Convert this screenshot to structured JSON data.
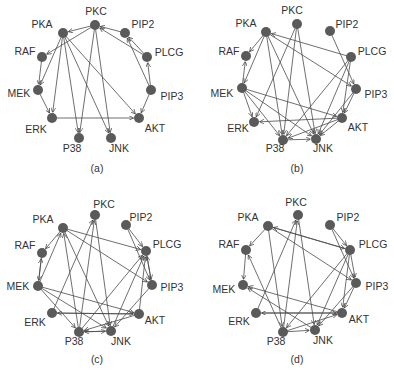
{
  "figure": {
    "panels": [
      {
        "caption": "(a)",
        "caption_pos": [
          97,
          172
        ],
        "nodes": {
          "PKC": {
            "x": 95,
            "y": 25,
            "lx": 96,
            "ly": 15,
            "anchor": "middle"
          },
          "PKA": {
            "x": 63,
            "y": 33,
            "lx": 42,
            "ly": 28,
            "anchor": "middle"
          },
          "PIP2": {
            "x": 125,
            "y": 33,
            "lx": 143,
            "ly": 28,
            "anchor": "middle"
          },
          "RAF": {
            "x": 42,
            "y": 57,
            "lx": 25,
            "ly": 55,
            "anchor": "middle"
          },
          "PLCG": {
            "x": 147,
            "y": 57,
            "lx": 169,
            "ly": 56,
            "anchor": "middle"
          },
          "MEK": {
            "x": 38,
            "y": 90,
            "lx": 19,
            "ly": 97,
            "anchor": "middle"
          },
          "PIP3": {
            "x": 151,
            "y": 90,
            "lx": 172,
            "ly": 100,
            "anchor": "middle"
          },
          "ERK": {
            "x": 52,
            "y": 118,
            "lx": 36,
            "ly": 133,
            "anchor": "middle"
          },
          "AKT": {
            "x": 139,
            "y": 118,
            "lx": 155,
            "ly": 132,
            "anchor": "middle"
          },
          "P38": {
            "x": 79,
            "y": 138,
            "lx": 72,
            "ly": 152,
            "anchor": "middle"
          },
          "JNK": {
            "x": 111,
            "y": 138,
            "lx": 119,
            "ly": 152,
            "anchor": "middle"
          }
        },
        "edges": [
          [
            "PKC",
            "PKA"
          ],
          [
            "PKC",
            "RAF"
          ],
          [
            "PKC",
            "P38"
          ],
          [
            "PKC",
            "JNK"
          ],
          [
            "PIP2",
            "PKC"
          ],
          [
            "PLCG",
            "PKC"
          ],
          [
            "PLCG",
            "PIP2"
          ],
          [
            "PIP3",
            "PLCG"
          ],
          [
            "PIP3",
            "PIP2"
          ],
          [
            "PIP3",
            "AKT"
          ],
          [
            "PKA",
            "MEK"
          ],
          [
            "PKA",
            "ERK"
          ],
          [
            "PKA",
            "P38"
          ],
          [
            "PKA",
            "JNK"
          ],
          [
            "PKA",
            "AKT"
          ],
          [
            "RAF",
            "MEK"
          ],
          [
            "MEK",
            "ERK"
          ],
          [
            "ERK",
            "AKT"
          ]
        ]
      },
      {
        "caption": "(b)",
        "caption_pos": [
          297,
          172
        ],
        "nodes": {
          "PKC": {
            "x": 297,
            "y": 24,
            "lx": 292,
            "ly": 14,
            "anchor": "middle"
          },
          "PKA": {
            "x": 266,
            "y": 32,
            "lx": 246,
            "ly": 27,
            "anchor": "middle"
          },
          "PIP2": {
            "x": 330,
            "y": 31,
            "lx": 347,
            "ly": 28,
            "anchor": "middle"
          },
          "RAF": {
            "x": 246,
            "y": 56,
            "lx": 229,
            "ly": 55,
            "anchor": "middle"
          },
          "PLCG": {
            "x": 351,
            "y": 57,
            "lx": 372,
            "ly": 55,
            "anchor": "middle"
          },
          "MEK": {
            "x": 242,
            "y": 88,
            "lx": 222,
            "ly": 97,
            "anchor": "middle"
          },
          "PIP3": {
            "x": 356,
            "y": 89,
            "lx": 376,
            "ly": 98,
            "anchor": "middle"
          },
          "ERK": {
            "x": 254,
            "y": 122,
            "lx": 238,
            "ly": 132,
            "anchor": "middle"
          },
          "AKT": {
            "x": 342,
            "y": 118,
            "lx": 358,
            "ly": 131,
            "anchor": "middle"
          },
          "P38": {
            "x": 283,
            "y": 140,
            "lx": 275,
            "ly": 152,
            "anchor": "middle"
          },
          "JNK": {
            "x": 316,
            "y": 139,
            "lx": 323,
            "ly": 152,
            "anchor": "middle"
          }
        },
        "edges": [
          [
            "PKA",
            "RAF"
          ],
          [
            "PKA",
            "MEK"
          ],
          [
            "PKA",
            "P38"
          ],
          [
            "PKA",
            "JNK"
          ],
          [
            "PKA",
            "PIP3"
          ],
          [
            "PLCG",
            "PKA"
          ],
          [
            "PKC",
            "ERK"
          ],
          [
            "PKC",
            "P38"
          ],
          [
            "PKC",
            "JNK"
          ],
          [
            "PIP2",
            "PIP3"
          ],
          [
            "PLCG",
            "P38"
          ],
          [
            "PLCG",
            "JNK"
          ],
          [
            "PLCG",
            "AKT"
          ],
          [
            "MEK",
            "RAF"
          ],
          [
            "MEK",
            "ERK"
          ],
          [
            "MEK",
            "JNK"
          ],
          [
            "MEK",
            "AKT"
          ],
          [
            "MEK",
            "P38"
          ],
          [
            "AKT",
            "ERK"
          ],
          [
            "AKT",
            "P38"
          ],
          [
            "AKT",
            "JNK"
          ],
          [
            "P38",
            "JNK"
          ],
          [
            "PIP3",
            "AKT"
          ],
          [
            "PIP3",
            "JNK"
          ]
        ]
      },
      {
        "caption": "(c)",
        "caption_pos": [
          97,
          363
        ],
        "nodes": {
          "PKC": {
            "x": 95,
            "y": 215,
            "lx": 104,
            "ly": 208,
            "anchor": "middle"
          },
          "PKA": {
            "x": 63,
            "y": 228,
            "lx": 43,
            "ly": 223,
            "anchor": "middle"
          },
          "PIP2": {
            "x": 126,
            "y": 225,
            "lx": 141,
            "ly": 221,
            "anchor": "middle"
          },
          "RAF": {
            "x": 42,
            "y": 253,
            "lx": 25,
            "ly": 249,
            "anchor": "middle"
          },
          "PLCG": {
            "x": 146,
            "y": 251,
            "lx": 167,
            "ly": 248,
            "anchor": "middle"
          },
          "MEK": {
            "x": 38,
            "y": 286,
            "lx": 18,
            "ly": 290,
            "anchor": "middle"
          },
          "PIP3": {
            "x": 152,
            "y": 285,
            "lx": 172,
            "ly": 291,
            "anchor": "middle"
          },
          "ERK": {
            "x": 52,
            "y": 313,
            "lx": 35,
            "ly": 326,
            "anchor": "middle"
          },
          "AKT": {
            "x": 139,
            "y": 314,
            "lx": 155,
            "ly": 324,
            "anchor": "middle"
          },
          "P38": {
            "x": 79,
            "y": 332,
            "lx": 74,
            "ly": 345,
            "anchor": "middle"
          },
          "JNK": {
            "x": 111,
            "y": 331,
            "lx": 121,
            "ly": 345,
            "anchor": "middle"
          }
        },
        "edges": [
          [
            "PKA",
            "RAF"
          ],
          [
            "PKA",
            "PLCG"
          ],
          [
            "PKA",
            "PIP3"
          ],
          [
            "PKA",
            "JNK"
          ],
          [
            "P38",
            "PKA"
          ],
          [
            "MEK",
            "PKA"
          ],
          [
            "PKC",
            "JNK"
          ],
          [
            "ERK",
            "PKC"
          ],
          [
            "P38",
            "PKC"
          ],
          [
            "PIP2",
            "PLCG"
          ],
          [
            "PIP2",
            "PIP3"
          ],
          [
            "PLCG",
            "PIP3"
          ],
          [
            "PIP3",
            "PLCG"
          ],
          [
            "P38",
            "PLCG"
          ],
          [
            "JNK",
            "PLCG"
          ],
          [
            "AKT",
            "PLCG"
          ],
          [
            "MEK",
            "RAF"
          ],
          [
            "RAF",
            "MEK"
          ],
          [
            "MEK",
            "AKT"
          ],
          [
            "MEK",
            "JNK"
          ],
          [
            "MEK",
            "P38"
          ],
          [
            "ERK",
            "AKT"
          ],
          [
            "AKT",
            "ERK"
          ],
          [
            "P38",
            "JNK"
          ],
          [
            "JNK",
            "P38"
          ],
          [
            "AKT",
            "P38"
          ],
          [
            "PIP3",
            "JNK"
          ]
        ]
      },
      {
        "caption": "(d)",
        "caption_pos": [
          297,
          363
        ],
        "nodes": {
          "PKC": {
            "x": 298,
            "y": 215,
            "lx": 296,
            "ly": 206,
            "anchor": "middle"
          },
          "PKA": {
            "x": 268,
            "y": 226,
            "lx": 248,
            "ly": 221,
            "anchor": "middle"
          },
          "PIP2": {
            "x": 330,
            "y": 225,
            "lx": 348,
            "ly": 221,
            "anchor": "middle"
          },
          "RAF": {
            "x": 246,
            "y": 250,
            "lx": 229,
            "ly": 248,
            "anchor": "middle"
          },
          "PLCG": {
            "x": 350,
            "y": 250,
            "lx": 373,
            "ly": 248,
            "anchor": "middle"
          },
          "MEK": {
            "x": 243,
            "y": 285,
            "lx": 224,
            "ly": 293,
            "anchor": "middle"
          },
          "PIP3": {
            "x": 356,
            "y": 283,
            "lx": 377,
            "ly": 290,
            "anchor": "middle"
          },
          "ERK": {
            "x": 256,
            "y": 313,
            "lx": 239,
            "ly": 325,
            "anchor": "middle"
          },
          "AKT": {
            "x": 342,
            "y": 313,
            "lx": 359,
            "ly": 323,
            "anchor": "middle"
          },
          "P38": {
            "x": 283,
            "y": 332,
            "lx": 276,
            "ly": 345,
            "anchor": "middle"
          },
          "JNK": {
            "x": 315,
            "y": 330,
            "lx": 323,
            "ly": 344,
            "anchor": "middle"
          }
        },
        "edges": [
          [
            "PKA",
            "RAF"
          ],
          [
            "PKA",
            "P38"
          ],
          [
            "PKA",
            "PLCG"
          ],
          [
            "PLCG",
            "PKA"
          ],
          [
            "PKA",
            "PIP3"
          ],
          [
            "PKC",
            "JNK"
          ],
          [
            "ERK",
            "PKC"
          ],
          [
            "P38",
            "PKC"
          ],
          [
            "P38",
            "RAF"
          ],
          [
            "PIP2",
            "PLCG"
          ],
          [
            "PIP2",
            "PIP3"
          ],
          [
            "PLCG",
            "PIP3"
          ],
          [
            "PLCG",
            "P38"
          ],
          [
            "PLCG",
            "JNK"
          ],
          [
            "PLCG",
            "AKT"
          ],
          [
            "RAF",
            "MEK"
          ],
          [
            "AKT",
            "MEK"
          ],
          [
            "JNK",
            "MEK"
          ],
          [
            "AKT",
            "ERK"
          ],
          [
            "ERK",
            "AKT"
          ],
          [
            "P38",
            "JNK"
          ],
          [
            "P38",
            "AKT"
          ],
          [
            "PIP3",
            "JNK"
          ],
          [
            "PIP3",
            "AKT"
          ]
        ]
      }
    ]
  }
}
